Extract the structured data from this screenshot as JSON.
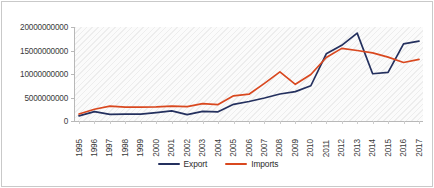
{
  "chart_data": {
    "type": "line",
    "title": "",
    "xlabel": "",
    "ylabel": "",
    "grid": false,
    "legend_position": "bottom",
    "ylim": [
      0,
      20000000000
    ],
    "yticks": [
      0,
      5000000000,
      10000000000,
      15000000000,
      20000000000
    ],
    "ytick_labels": [
      "0",
      "5000000000",
      "10000000000",
      "15000000000",
      "20000000000"
    ],
    "categories": [
      "1995",
      "1996",
      "1997",
      "1998",
      "1999",
      "2000",
      "2001",
      "2002",
      "2003",
      "2004",
      "2005",
      "2006",
      "2007",
      "2008",
      "2009",
      "2010",
      "2011",
      "2012",
      "2013",
      "2014",
      "2015",
      "2016",
      "2017"
    ],
    "series": [
      {
        "name": "Export",
        "color": "#24305E",
        "values": [
          1100000000,
          2000000000,
          1400000000,
          1450000000,
          1450000000,
          1800000000,
          2150000000,
          1350000000,
          2050000000,
          1950000000,
          3550000000,
          4150000000,
          4900000000,
          5750000000,
          6250000000,
          7500000000,
          14300000000,
          16100000000,
          18700000000,
          10050000000,
          10350000000,
          16400000000,
          17000000000
        ]
      },
      {
        "name": "Imports",
        "color": "#D9481F",
        "values": [
          1500000000,
          2500000000,
          3150000000,
          2950000000,
          2950000000,
          3000000000,
          3150000000,
          3050000000,
          3700000000,
          3500000000,
          5350000000,
          5700000000,
          8000000000,
          10450000000,
          7800000000,
          9900000000,
          13500000000,
          15450000000,
          15000000000,
          14500000000,
          13600000000,
          12450000000,
          13100000000
        ]
      }
    ]
  },
  "legend": {
    "items": [
      {
        "label": "Export",
        "color": "#24305E"
      },
      {
        "label": "Imports",
        "color": "#D9481F"
      }
    ]
  }
}
